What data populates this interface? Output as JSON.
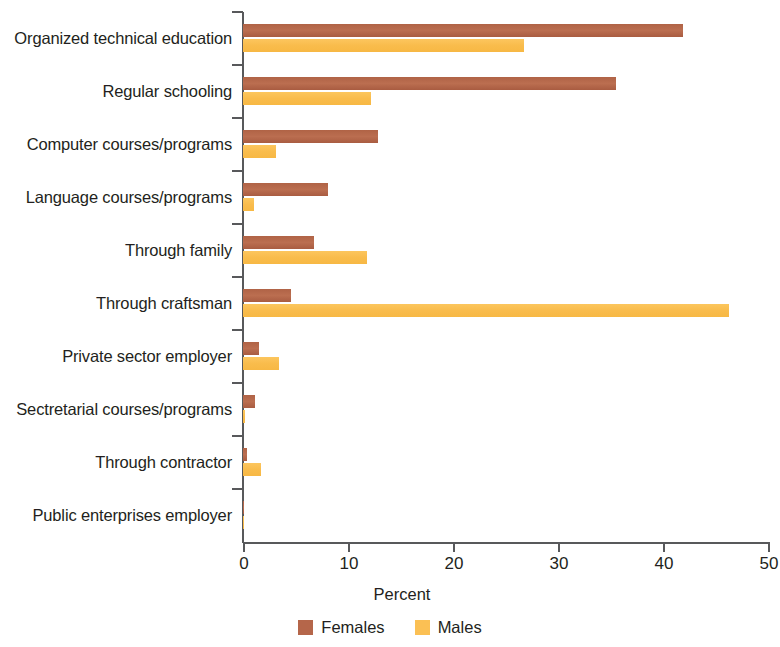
{
  "chart_data": {
    "type": "bar",
    "orientation": "horizontal",
    "title": "",
    "xlabel": "Percent",
    "ylabel": "",
    "xlim": [
      0,
      50
    ],
    "xticks": [
      "0",
      "10",
      "20",
      "30",
      "40",
      "50"
    ],
    "grid": false,
    "legend_position": "bottom",
    "categories": [
      "Organized technical education",
      "Regular schooling",
      "Computer courses/programs",
      "Language courses/programs",
      "Through family",
      "Through craftsman",
      "Private sector employer",
      "Sectretarial courses/programs",
      "Through contractor",
      "Public enterprises employer"
    ],
    "series": [
      {
        "name": "Females",
        "color": "#b5664a",
        "values": [
          41.9,
          35.5,
          12.9,
          8.1,
          6.8,
          4.6,
          1.5,
          1.1,
          0.4,
          0.05
        ]
      },
      {
        "name": "Males",
        "color": "#fbc054",
        "values": [
          26.8,
          12.2,
          3.1,
          1.0,
          11.8,
          46.3,
          3.4,
          0.2,
          1.7,
          0.05
        ]
      }
    ]
  },
  "axis": {
    "x_title": "Percent"
  },
  "legend": {
    "items": [
      {
        "label": "Females"
      },
      {
        "label": "Males"
      }
    ]
  }
}
